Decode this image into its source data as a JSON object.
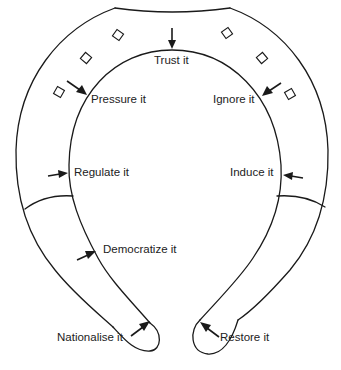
{
  "diagram": {
    "type": "horseshoe",
    "stroke_color": "#1a1a1a",
    "background_color": "#ffffff",
    "labels": {
      "trust": "Trust it",
      "pressure": "Pressure it",
      "ignore": "Ignore it",
      "regulate": "Regulate it",
      "induce": "Induce it",
      "democratize": "Democratize it",
      "nationalise": "Nationalise it",
      "restore": "Restore it"
    },
    "nail_holes": {
      "count": 6,
      "shape": "square-rotated",
      "left_side": 3,
      "right_side": 3
    }
  }
}
